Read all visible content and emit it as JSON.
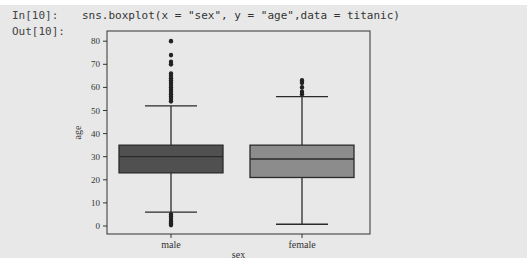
{
  "cell": {
    "in_prompt": "In[10]:",
    "out_prompt": "Out[10]:",
    "code": "sns.boxplot(x = \"sex\", y = \"age\",data = titanic)"
  },
  "colors": {
    "cell_bg": "#e8e8e8",
    "male_box": "#505050",
    "female_box": "#8c8c8c",
    "line": "#2a2a2a"
  },
  "chart_data": {
    "type": "boxplot",
    "title": "",
    "xlabel": "sex",
    "ylabel": "age",
    "categories": [
      "male",
      "female"
    ],
    "yticks": [
      0,
      10,
      20,
      30,
      40,
      50,
      60,
      70,
      80
    ],
    "ylim": [
      -3,
      85
    ],
    "boxes": [
      {
        "name": "male",
        "whisker_low": 6,
        "q1": 23,
        "median": 30,
        "q3": 35,
        "whisker_high": 52,
        "outliers_high": [
          54,
          55,
          56,
          57,
          58,
          59,
          60,
          61,
          62,
          63,
          64,
          65,
          66,
          70,
          71,
          74,
          80
        ],
        "outliers_low": [
          0.4,
          0.9,
          1,
          2,
          3,
          4,
          5
        ]
      },
      {
        "name": "female",
        "whisker_low": 0.75,
        "q1": 21,
        "median": 29,
        "q3": 35,
        "whisker_high": 56,
        "outliers_high": [
          57,
          58,
          60,
          62,
          63
        ]
      }
    ]
  }
}
